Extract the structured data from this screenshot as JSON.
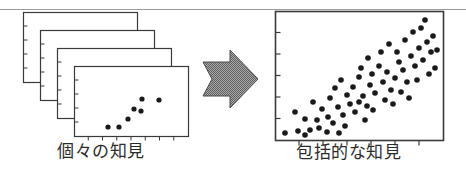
{
  "figure": {
    "type": "diagram",
    "background_color": "#ffffff",
    "ink_color": "#2b2b2b",
    "top_rule": {
      "name": "scan-rule",
      "y": 9,
      "x1": 0,
      "x2": 466,
      "color": "#9a9a9a"
    },
    "left_panel": {
      "label": "個々の知見",
      "label_reading": "kokoko no chiken",
      "label_meaning": "individual findings",
      "card_count": 4,
      "card_width": 114,
      "card_height": 70,
      "offset_x": 17,
      "offset_y": 18,
      "first_card_x": 23,
      "first_card_y": 12,
      "border_color": "#3a3a3a",
      "fill_color": "#ffffff"
    },
    "arrow": {
      "name": "transform-arrow",
      "direction": "right",
      "x": 203,
      "y": 50,
      "width": 56,
      "height": 58,
      "fill_color": "#808080",
      "pattern": "halftone-dither",
      "outline_color": "#4a4a4a"
    },
    "right_panel": {
      "label": "包括的な知見",
      "label_reading": "houkatsuteki na chiken",
      "label_meaning": "comprehensive findings",
      "frame_x": 275,
      "frame_y": 11,
      "frame_width": 168,
      "frame_height": 129,
      "border_color": "#3a3a3a",
      "fill_color": "#ffffff"
    }
  },
  "chart_data": [
    {
      "type": "scatter",
      "name": "individual-study-scatter",
      "title": "個々の知見",
      "xlabel": "",
      "ylabel": "",
      "xlim": [
        0,
        114
      ],
      "ylim": [
        0,
        70
      ],
      "grid": false,
      "legend": false,
      "axis_ticks": {
        "x_count": 7,
        "y_count": 5
      },
      "point_radius": 2.6,
      "point_color": "#1a1a1a",
      "points": [
        {
          "x": 34,
          "y": 9
        },
        {
          "x": 45,
          "y": 9
        },
        {
          "x": 54,
          "y": 17
        },
        {
          "x": 60,
          "y": 27
        },
        {
          "x": 67,
          "y": 25
        },
        {
          "x": 68,
          "y": 37
        },
        {
          "x": 85,
          "y": 36
        }
      ]
    },
    {
      "type": "scatter",
      "name": "pooled-scatter",
      "title": "包括的な知見",
      "xlabel": "",
      "ylabel": "",
      "xlim": [
        0,
        168
      ],
      "ylim": [
        0,
        129
      ],
      "grid": false,
      "legend": false,
      "axis_ticks": {
        "x_count": 6,
        "y_count": 5
      },
      "point_radius": 2.8,
      "point_color": "#1a1a1a",
      "points": [
        {
          "x": 10,
          "y": 7
        },
        {
          "x": 23,
          "y": 9
        },
        {
          "x": 30,
          "y": 21
        },
        {
          "x": 35,
          "y": 10
        },
        {
          "x": 20,
          "y": 28
        },
        {
          "x": 42,
          "y": 20
        },
        {
          "x": 47,
          "y": 31
        },
        {
          "x": 38,
          "y": 38
        },
        {
          "x": 53,
          "y": 23
        },
        {
          "x": 58,
          "y": 17
        },
        {
          "x": 55,
          "y": 42
        },
        {
          "x": 63,
          "y": 33
        },
        {
          "x": 68,
          "y": 25
        },
        {
          "x": 60,
          "y": 52
        },
        {
          "x": 72,
          "y": 45
        },
        {
          "x": 66,
          "y": 60
        },
        {
          "x": 75,
          "y": 36
        },
        {
          "x": 80,
          "y": 28
        },
        {
          "x": 78,
          "y": 53
        },
        {
          "x": 84,
          "y": 63
        },
        {
          "x": 88,
          "y": 44
        },
        {
          "x": 92,
          "y": 34
        },
        {
          "x": 86,
          "y": 72
        },
        {
          "x": 95,
          "y": 55
        },
        {
          "x": 100,
          "y": 47
        },
        {
          "x": 97,
          "y": 66
        },
        {
          "x": 104,
          "y": 74
        },
        {
          "x": 93,
          "y": 82
        },
        {
          "x": 108,
          "y": 58
        },
        {
          "x": 112,
          "y": 68
        },
        {
          "x": 106,
          "y": 88
        },
        {
          "x": 116,
          "y": 50
        },
        {
          "x": 120,
          "y": 62
        },
        {
          "x": 114,
          "y": 96
        },
        {
          "x": 124,
          "y": 78
        },
        {
          "x": 128,
          "y": 70
        },
        {
          "x": 122,
          "y": 88
        },
        {
          "x": 132,
          "y": 58
        },
        {
          "x": 136,
          "y": 84
        },
        {
          "x": 130,
          "y": 100
        },
        {
          "x": 140,
          "y": 74
        },
        {
          "x": 144,
          "y": 92
        },
        {
          "x": 138,
          "y": 108
        },
        {
          "x": 148,
          "y": 80
        },
        {
          "x": 152,
          "y": 98
        },
        {
          "x": 146,
          "y": 112
        },
        {
          "x": 156,
          "y": 88
        },
        {
          "x": 158,
          "y": 104
        },
        {
          "x": 150,
          "y": 120
        },
        {
          "x": 160,
          "y": 72
        },
        {
          "x": 44,
          "y": 12
        },
        {
          "x": 52,
          "y": 8
        },
        {
          "x": 70,
          "y": 14
        },
        {
          "x": 90,
          "y": 20
        },
        {
          "x": 84,
          "y": 38
        },
        {
          "x": 98,
          "y": 30
        },
        {
          "x": 110,
          "y": 40
        },
        {
          "x": 118,
          "y": 36
        },
        {
          "x": 126,
          "y": 48
        },
        {
          "x": 134,
          "y": 42
        },
        {
          "x": 142,
          "y": 60
        },
        {
          "x": 154,
          "y": 66
        },
        {
          "x": 162,
          "y": 90
        },
        {
          "x": 30,
          "y": 5
        },
        {
          "x": 64,
          "y": 7
        }
      ]
    }
  ]
}
